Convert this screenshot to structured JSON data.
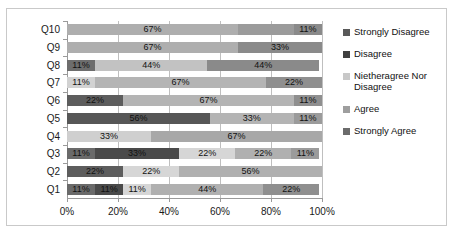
{
  "chart_data": {
    "type": "bar",
    "subtype": "horizontal-stacked-100",
    "title": "",
    "xlabel": "",
    "ylabel": "",
    "xlim": [
      0,
      100
    ],
    "xticks": [
      "0%",
      "20%",
      "40%",
      "60%",
      "80%",
      "100%"
    ],
    "xtick_values": [
      0,
      20,
      40,
      60,
      80,
      100
    ],
    "grid": true,
    "legend_position": "right",
    "categories": [
      "Q1",
      "Q2",
      "Q3",
      "Q4",
      "Q5",
      "Q6",
      "Q7",
      "Q8",
      "Q9",
      "Q10"
    ],
    "categories_display_order": [
      "Q10",
      "Q9",
      "Q8",
      "Q7",
      "Q6",
      "Q5",
      "Q4",
      "Q3",
      "Q2",
      "Q1"
    ],
    "series": [
      {
        "name": "Strongly Disagree",
        "color": "#595959",
        "values": [
          11,
          22,
          11,
          0,
          56,
          22,
          0,
          11,
          0,
          0
        ]
      },
      {
        "name": "Disagree",
        "color": "#404040",
        "values": [
          11,
          0,
          33,
          0,
          0,
          0,
          0,
          0,
          0,
          0
        ]
      },
      {
        "name": "Nietheragree Nor Disagree",
        "color": "#d0d0d0",
        "values": [
          11,
          22,
          22,
          33,
          0,
          0,
          11,
          44,
          0,
          0
        ]
      },
      {
        "name": "Agree",
        "color": "#aeaeae",
        "values": [
          44,
          56,
          22,
          67,
          33,
          67,
          67,
          0,
          67,
          67
        ]
      },
      {
        "name": "Strongly Agree",
        "color": "#7d7d7d",
        "values": [
          22,
          0,
          11,
          0,
          11,
          11,
          22,
          44,
          33,
          33
        ]
      }
    ],
    "rows": [
      {
        "category": "Q10",
        "segments": [
          {
            "series": "Agree",
            "value": 67,
            "label": "67%",
            "color": "#aeaeae"
          },
          {
            "series": "Strongly Agree",
            "value": 22,
            "label": "",
            "color": "#9b9b9b"
          },
          {
            "series": "Strongly Agree",
            "value": 11,
            "label": "11%",
            "color": "#8a8a8a"
          }
        ]
      },
      {
        "category": "Q9",
        "segments": [
          {
            "series": "Agree",
            "value": 67,
            "label": "67%",
            "color": "#aeaeae"
          },
          {
            "series": "Strongly Agree",
            "value": 33,
            "label": "33%",
            "color": "#8a8a8a"
          }
        ]
      },
      {
        "category": "Q8",
        "segments": [
          {
            "series": "Strongly Disagree",
            "value": 11,
            "label": "11%",
            "color": "#6d6d6d"
          },
          {
            "series": "Nietheragree Nor Disagree",
            "value": 44,
            "label": "44%",
            "color": "#c2c2c2"
          },
          {
            "series": "Strongly Agree",
            "value": 44,
            "label": "44%",
            "color": "#8a8a8a"
          }
        ]
      },
      {
        "category": "Q7",
        "segments": [
          {
            "series": "Nietheragree Nor Disagree",
            "value": 11,
            "label": "11%",
            "color": "#d2d2d2"
          },
          {
            "series": "Agree",
            "value": 67,
            "label": "67%",
            "color": "#b4b4b4"
          },
          {
            "series": "Strongly Agree",
            "value": 22,
            "label": "22%",
            "color": "#8f8f8f"
          }
        ]
      },
      {
        "category": "Q6",
        "segments": [
          {
            "series": "Strongly Disagree",
            "value": 22,
            "label": "22%",
            "color": "#5d5d5d"
          },
          {
            "series": "Agree",
            "value": 67,
            "label": "67%",
            "color": "#b4b4b4"
          },
          {
            "series": "Strongly Agree",
            "value": 11,
            "label": "11%",
            "color": "#8f8f8f"
          }
        ]
      },
      {
        "category": "Q5",
        "segments": [
          {
            "series": "Strongly Disagree",
            "value": 56,
            "label": "56%",
            "color": "#575757"
          },
          {
            "series": "Agree",
            "value": 33,
            "label": "33%",
            "color": "#b4b4b4"
          },
          {
            "series": "Strongly Agree",
            "value": 11,
            "label": "11%",
            "color": "#9b9b9b"
          }
        ]
      },
      {
        "category": "Q4",
        "segments": [
          {
            "series": "Nietheragree Nor Disagree",
            "value": 33,
            "label": "33%",
            "color": "#cfcfcf"
          },
          {
            "series": "Agree",
            "value": 67,
            "label": "67%",
            "color": "#a8a8a8"
          }
        ]
      },
      {
        "category": "Q3",
        "segments": [
          {
            "series": "Strongly Disagree",
            "value": 11,
            "label": "11%",
            "color": "#6a6a6a"
          },
          {
            "series": "Disagree",
            "value": 33,
            "label": "33%",
            "color": "#4a4a4a"
          },
          {
            "series": "Nietheragree Nor Disagree",
            "value": 22,
            "label": "22%",
            "color": "#d6d6d6"
          },
          {
            "series": "Agree",
            "value": 22,
            "label": "22%",
            "color": "#b0b0b0"
          },
          {
            "series": "Strongly Agree",
            "value": 11,
            "label": "11%",
            "color": "#9b9b9b"
          }
        ]
      },
      {
        "category": "Q2",
        "segments": [
          {
            "series": "Strongly Disagree",
            "value": 22,
            "label": "22%",
            "color": "#5d5d5d"
          },
          {
            "series": "Nietheragree Nor Disagree",
            "value": 22,
            "label": "22%",
            "color": "#d6d6d6"
          },
          {
            "series": "Agree",
            "value": 56,
            "label": "56%",
            "color": "#b0b0b0"
          }
        ]
      },
      {
        "category": "Q1",
        "segments": [
          {
            "series": "Strongly Disagree",
            "value": 11,
            "label": "11%",
            "color": "#6a6a6a"
          },
          {
            "series": "Disagree",
            "value": 11,
            "label": "11%",
            "color": "#4a4a4a"
          },
          {
            "series": "Nietheragree Nor Disagree",
            "value": 11,
            "label": "11%",
            "color": "#d6d6d6"
          },
          {
            "series": "Agree",
            "value": 44,
            "label": "44%",
            "color": "#b0b0b0"
          },
          {
            "series": "Strongly Agree",
            "value": 22,
            "label": "22%",
            "color": "#8f8f8f"
          }
        ]
      }
    ],
    "legend": [
      {
        "label": "Strongly Disagree",
        "color": "#595959"
      },
      {
        "label": "Disagree",
        "color": "#404040"
      },
      {
        "label": "Nietheragree Nor Disagree",
        "color": "#c8c8c8"
      },
      {
        "label": "Agree",
        "color": "#9e9e9e"
      },
      {
        "label": "Strongly Agree",
        "color": "#6b6b6b"
      }
    ]
  }
}
